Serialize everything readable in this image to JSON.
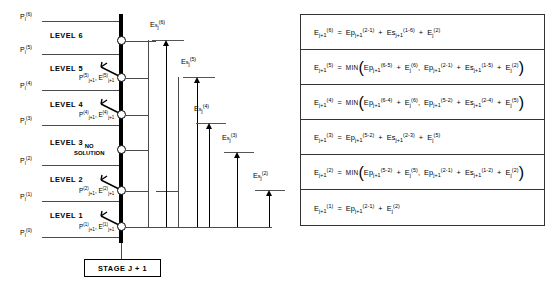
{
  "diagram": {
    "levels": [
      {
        "name": "LEVEL 6",
        "index": 6
      },
      {
        "name": "LEVEL 5",
        "index": 5
      },
      {
        "name": "LEVEL 4",
        "index": 4
      },
      {
        "name": "LEVEL 3",
        "index": 3
      },
      {
        "name": "LEVEL 2",
        "index": 2
      },
      {
        "name": "LEVEL 1",
        "index": 1
      }
    ],
    "pressure_labels": [
      {
        "text": "Pₗ(6)",
        "base": "P",
        "sub": "l",
        "sup": "(6)"
      },
      {
        "text": "Pₗ(5)",
        "base": "P",
        "sub": "l",
        "sup": "(5)"
      },
      {
        "text": "Pₗ(4)",
        "base": "P",
        "sub": "l",
        "sup": "(4)"
      },
      {
        "text": "Pₗ(3)",
        "base": "P",
        "sub": "l",
        "sup": "(3)"
      },
      {
        "text": "Pₗ(2)",
        "base": "P",
        "sub": "l",
        "sup": "(2)"
      },
      {
        "text": "Pₗ(1)",
        "base": "P",
        "sub": "l",
        "sup": "(1)"
      },
      {
        "text": "Pₗ(0)",
        "base": "P",
        "sub": "l",
        "sup": "(0)"
      }
    ],
    "node_labels": [
      {
        "p": "P(5) j+1",
        "e": "E(5) j+1",
        "level": 5
      },
      {
        "p": "P(4) j+1",
        "e": "E(4) j+1",
        "level": 4
      },
      {
        "p": "P(2) j+1",
        "e": "E(2) j+1",
        "level": 2
      },
      {
        "p": "P(1) j+1",
        "e": "E(1) j+1",
        "level": 1
      }
    ],
    "no_solution_line1": "NO",
    "no_solution_line2": "SOLUTION",
    "es_labels": [
      {
        "sup": "(6)",
        "sub": "j"
      },
      {
        "sup": "(5)",
        "sub": "j"
      },
      {
        "sup": "(4)",
        "sub": "j"
      },
      {
        "sup": "(3)",
        "sub": "j"
      },
      {
        "sup": "(2)",
        "sub": "j"
      }
    ],
    "stage_label": "STAGE J + 1"
  },
  "equations": [
    {
      "id": "eq-6",
      "lhs_base": "E",
      "lhs_sup": "(6)",
      "lhs_sub": "j+1",
      "text": "E(6)j+1 = Ep(2-1)j+1 + Es(1-6)j+1 + E(2)j",
      "terms": [
        {
          "base": "Ep",
          "sup": "(2-1)",
          "sub": "j+1"
        },
        {
          "base": "Es",
          "sup": "(1-6)",
          "sub": "j+1"
        },
        {
          "base": "E",
          "sup": "(2)",
          "sub": "j"
        }
      ],
      "min": false
    },
    {
      "id": "eq-5",
      "lhs_base": "E",
      "lhs_sup": "(5)",
      "lhs_sub": "j+1",
      "text": "E(5)j+1 = MIN( Ep(6-5)j+1 + E(6)j , Ep(2-1)j+1 + Es(1-5)j+1 + E(2)j )",
      "min": true,
      "min_label": "MIN",
      "branch_a": [
        {
          "base": "Ep",
          "sup": "(6-5)",
          "sub": "j+1"
        },
        {
          "base": "E",
          "sup": "(6)",
          "sub": "j"
        }
      ],
      "branch_b": [
        {
          "base": "Ep",
          "sup": "(2-1)",
          "sub": "j+1"
        },
        {
          "base": "Es",
          "sup": "(1-5)",
          "sub": "j+1"
        },
        {
          "base": "E",
          "sup": "(2)",
          "sub": "j"
        }
      ]
    },
    {
      "id": "eq-4",
      "lhs_base": "E",
      "lhs_sup": "(4)",
      "lhs_sub": "j+1",
      "text": "E(4)j+1 = MIN( Ep(6-4)j+1 + E(6)j , Ep(5-2)j+1 + Es(2-4)j+1 + E(5)j )",
      "min": true,
      "min_label": "MIN",
      "branch_a": [
        {
          "base": "Ep",
          "sup": "(6-4)",
          "sub": "j+1"
        },
        {
          "base": "E",
          "sup": "(6)",
          "sub": "j"
        }
      ],
      "branch_b": [
        {
          "base": "Ep",
          "sup": "(5-2)",
          "sub": "j+1"
        },
        {
          "base": "Es",
          "sup": "(2-4)",
          "sub": "j+1"
        },
        {
          "base": "E",
          "sup": "(5)",
          "sub": "j"
        }
      ]
    },
    {
      "id": "eq-3",
      "lhs_base": "E",
      "lhs_sup": "(3)",
      "lhs_sub": "j+1",
      "text": "E(3)j+1 = Ep(5-2)j+1 + Es(2-3)j+1 + E(5)j",
      "min": false,
      "terms": [
        {
          "base": "Ep",
          "sup": "(5-2)",
          "sub": "j+1"
        },
        {
          "base": "Es",
          "sup": "(2-3)",
          "sub": "j+1"
        },
        {
          "base": "E",
          "sup": "(5)",
          "sub": "j"
        }
      ]
    },
    {
      "id": "eq-2",
      "lhs_base": "E",
      "lhs_sup": "(2)",
      "lhs_sub": "j+1",
      "text": "E(2)j+1 = MIN( Ep(5-2)j+1 + E(5)j , Ep(2-1)j+1 + Es(1-2)j+1 + E(2)j )",
      "min": true,
      "min_label": "MIN",
      "branch_a": [
        {
          "base": "Ep",
          "sup": "(5-2)",
          "sub": "j+1"
        },
        {
          "base": "E",
          "sup": "(5)",
          "sub": "j"
        }
      ],
      "branch_b": [
        {
          "base": "Ep",
          "sup": "(2-1)",
          "sub": "j+1"
        },
        {
          "base": "Es",
          "sup": "(1-2)",
          "sub": "j+1"
        },
        {
          "base": "E",
          "sup": "(2)",
          "sub": "j"
        }
      ]
    },
    {
      "id": "eq-1",
      "lhs_base": "E",
      "lhs_sup": "(1)",
      "lhs_sub": "j+1",
      "text": "E(1)j+1 = Ep(2-1)j+1 + E(2)j",
      "min": false,
      "terms": [
        {
          "base": "Ep",
          "sup": "(2-1)",
          "sub": "j+1"
        },
        {
          "base": "E",
          "sup": "(2)",
          "sub": "j"
        }
      ]
    }
  ],
  "colors": {
    "ink": "#000000",
    "rule": "#4a4a4a",
    "background": "#ffffff"
  }
}
